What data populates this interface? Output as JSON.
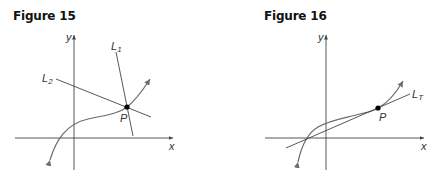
{
  "figures": [
    {
      "title": "Figure 15",
      "axes": {
        "x_label": "x",
        "y_label": "y"
      },
      "lines": [
        {
          "name": "L",
          "sub": "1"
        },
        {
          "name": "L",
          "sub": "2"
        }
      ],
      "point": {
        "label": "P"
      },
      "description": "Curve with two lines L1 and L2 intersecting at point P on the curve"
    },
    {
      "title": "Figure 16",
      "axes": {
        "x_label": "x",
        "y_label": "y"
      },
      "lines": [
        {
          "name": "L",
          "sub": "T"
        }
      ],
      "point": {
        "label": "P"
      },
      "description": "Curve with tangent line LT touching at point P"
    }
  ],
  "colors": {
    "axis": "#444444",
    "curve": "#6b6b6b",
    "line": "#444444",
    "point": "#000000",
    "text": "#111111"
  }
}
